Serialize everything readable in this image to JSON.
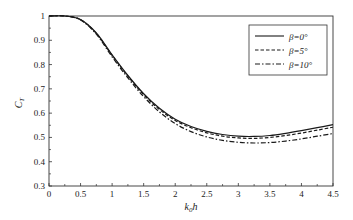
{
  "chart_data": {
    "type": "line",
    "title": "",
    "xlabel": "k0h",
    "xlabel_main": "k",
    "xlabel_sub": "0",
    "xlabel_tail": "h",
    "ylabel": "CT",
    "ylabel_main": "C",
    "ylabel_sub": "T",
    "xlim": [
      0,
      4.5
    ],
    "ylim": [
      0.3,
      1.0
    ],
    "xticks": [
      0,
      0.5,
      1,
      1.5,
      2,
      2.5,
      3,
      3.5,
      4,
      4.5
    ],
    "xtick_labels": [
      "0",
      "0.5",
      "1",
      "1.5",
      "2",
      "2.5",
      "3",
      "3.5",
      "4",
      "4.5"
    ],
    "yticks": [
      0.3,
      0.4,
      0.5,
      0.6,
      0.7,
      0.8,
      0.9,
      1.0
    ],
    "ytick_labels": [
      "0.3",
      "0.4",
      "0.5",
      "0.6",
      "0.7",
      "0.8",
      "0.9",
      "1"
    ],
    "grid": false,
    "legend_position": "upper right",
    "x": [
      0,
      0.25,
      0.5,
      0.75,
      1.0,
      1.25,
      1.5,
      1.75,
      2.0,
      2.25,
      2.5,
      2.75,
      3.0,
      3.25,
      3.5,
      3.75,
      4.0,
      4.25,
      4.5
    ],
    "series": [
      {
        "name": "β=0°",
        "legend_label": "β=0°",
        "style": "solid",
        "values": [
          1.0,
          1.0,
          0.985,
          0.93,
          0.84,
          0.755,
          0.68,
          0.62,
          0.575,
          0.545,
          0.525,
          0.512,
          0.505,
          0.504,
          0.508,
          0.517,
          0.528,
          0.54,
          0.553
        ]
      },
      {
        "name": "β=5°",
        "legend_label": "β=5°",
        "style": "dashed",
        "values": [
          1.0,
          1.0,
          0.985,
          0.928,
          0.838,
          0.752,
          0.676,
          0.615,
          0.57,
          0.54,
          0.519,
          0.505,
          0.498,
          0.496,
          0.5,
          0.508,
          0.518,
          0.53,
          0.542
        ]
      },
      {
        "name": "β=10°",
        "legend_label": "β=10°",
        "style": "dashdot",
        "values": [
          1.0,
          1.0,
          0.984,
          0.925,
          0.832,
          0.745,
          0.668,
          0.605,
          0.557,
          0.524,
          0.502,
          0.488,
          0.48,
          0.477,
          0.479,
          0.485,
          0.494,
          0.505,
          0.516
        ]
      }
    ]
  },
  "colors": {
    "line": "#1a1a1a",
    "axis": "#333333",
    "background": "#ffffff"
  }
}
